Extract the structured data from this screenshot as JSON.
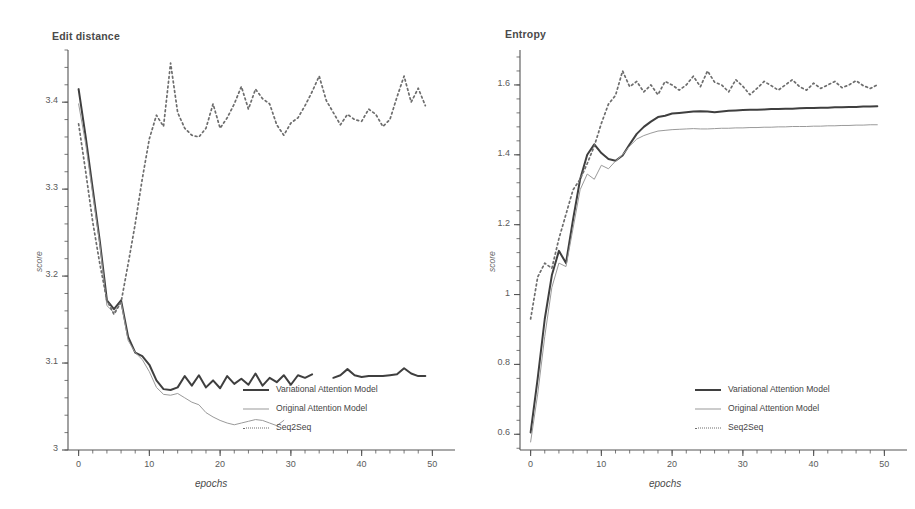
{
  "figure": {
    "background": "#ffffff",
    "colors": {
      "variational": "#3f3f3f",
      "original": "#9a9a9a",
      "seq2seq": "#6d6d6d",
      "axis": "#555555",
      "text": "#4a4a4a"
    }
  },
  "legend_labels": {
    "variational": "Variational Attention Model",
    "original": "Original Attention Model",
    "seq2seq": "Seq2Seq"
  },
  "panels": [
    {
      "title": "Edit distance",
      "xlabel": "epochs",
      "ylabel": "score"
    },
    {
      "title": "Entropy",
      "xlabel": "epochs",
      "ylabel": "score"
    }
  ],
  "chart_data": [
    {
      "type": "line",
      "title": "Edit distance",
      "xlabel": "epochs",
      "ylabel": "score",
      "xlim": [
        -1.5,
        51.5
      ],
      "ylim": [
        3.0,
        3.46
      ],
      "xticks": [
        0,
        10,
        20,
        30,
        40,
        50
      ],
      "xtick_labels": [
        "0",
        "10",
        "20",
        "30",
        "40",
        "50"
      ],
      "yticks": [
        3.0,
        3.1,
        3.2,
        3.3,
        3.4
      ],
      "ytick_labels": [
        "3",
        "3.1",
        "3.2",
        "3.3",
        "3.4"
      ],
      "minor_ticks": true,
      "grid": false,
      "legend_position": "lower right",
      "x": [
        0,
        1,
        2,
        3,
        4,
        5,
        6,
        7,
        8,
        9,
        10,
        11,
        12,
        13,
        14,
        15,
        16,
        17,
        18,
        19,
        20,
        21,
        22,
        23,
        24,
        25,
        26,
        27,
        28,
        29,
        30,
        31,
        32,
        33,
        34,
        35,
        36,
        37,
        38,
        39,
        40,
        41,
        42,
        43,
        44,
        45,
        46,
        47,
        48,
        49
      ],
      "series": [
        {
          "name": "Variational Attention Model",
          "style": "solid-thick",
          "color": "#3f3f3f",
          "values": [
            3.415,
            3.36,
            3.3,
            3.24,
            3.172,
            3.162,
            3.172,
            3.13,
            3.112,
            3.108,
            3.098,
            3.08,
            3.07,
            3.069,
            3.072,
            3.085,
            3.074,
            3.086,
            3.072,
            3.08,
            3.071,
            3.085,
            3.076,
            3.082,
            3.075,
            3.088,
            3.074,
            3.083,
            3.078,
            3.086,
            3.075,
            3.086,
            3.083,
            3.087,
            null,
            null,
            3.083,
            3.086,
            3.093,
            3.086,
            3.084,
            3.085,
            3.085,
            3.085,
            3.086,
            3.087,
            3.094,
            3.088,
            3.085,
            3.085
          ]
        },
        {
          "name": "Original Attention Model",
          "style": "solid-thin",
          "color": "#9a9a9a",
          "values": [
            3.398,
            3.352,
            3.294,
            3.236,
            3.166,
            3.158,
            3.17,
            3.126,
            3.112,
            3.104,
            3.09,
            3.072,
            3.064,
            3.063,
            3.065,
            3.06,
            3.055,
            3.052,
            3.043,
            3.038,
            3.034,
            3.031,
            3.029,
            3.031,
            3.033,
            3.035,
            3.034,
            3.031,
            3.028,
            3.034,
            null,
            null,
            null,
            null,
            null,
            null,
            null,
            null,
            null,
            null,
            null,
            null,
            null,
            null,
            null,
            null,
            null,
            null,
            null,
            null
          ]
        },
        {
          "name": "Seq2Seq",
          "style": "dotted",
          "color": "#6d6d6d",
          "values": [
            3.375,
            3.32,
            3.262,
            3.214,
            3.172,
            3.156,
            3.17,
            3.214,
            3.26,
            3.312,
            3.358,
            3.385,
            3.372,
            3.445,
            3.388,
            3.37,
            3.362,
            3.36,
            3.37,
            3.398,
            3.37,
            3.382,
            3.398,
            3.418,
            3.392,
            3.415,
            3.404,
            3.398,
            3.374,
            3.362,
            3.376,
            3.382,
            3.396,
            3.412,
            3.43,
            3.402,
            3.388,
            3.374,
            3.386,
            3.38,
            3.378,
            3.392,
            3.386,
            3.372,
            3.38,
            3.406,
            3.43,
            3.4,
            3.416,
            3.396
          ]
        }
      ]
    },
    {
      "type": "line",
      "title": "Entropy",
      "xlabel": "epochs",
      "ylabel": "score",
      "xlim": [
        -1.5,
        51.5
      ],
      "ylim": [
        0.555,
        1.7
      ],
      "xticks": [
        0,
        10,
        20,
        30,
        40,
        50
      ],
      "xtick_labels": [
        "0",
        "10",
        "20",
        "30",
        "40",
        "50"
      ],
      "yticks": [
        0.6,
        0.8,
        1.0,
        1.2,
        1.4,
        1.6
      ],
      "ytick_labels": [
        "0.6",
        "0.8",
        "1",
        "1.2",
        "1.4",
        "1.6"
      ],
      "minor_ticks": true,
      "grid": false,
      "legend_position": "lower right",
      "x": [
        0,
        1,
        2,
        3,
        4,
        5,
        6,
        7,
        8,
        9,
        10,
        11,
        12,
        13,
        14,
        15,
        16,
        17,
        18,
        19,
        20,
        21,
        22,
        23,
        24,
        25,
        26,
        27,
        28,
        29,
        30,
        31,
        32,
        33,
        34,
        35,
        36,
        37,
        38,
        39,
        40,
        41,
        42,
        43,
        44,
        45,
        46,
        47,
        48,
        49
      ],
      "series": [
        {
          "name": "Variational Attention Model",
          "style": "solid-thick",
          "color": "#3f3f3f",
          "values": [
            0.605,
            0.76,
            0.93,
            1.055,
            1.125,
            1.09,
            1.215,
            1.33,
            1.4,
            1.43,
            1.405,
            1.388,
            1.383,
            1.398,
            1.43,
            1.46,
            1.48,
            1.495,
            1.508,
            1.512,
            1.518,
            1.52,
            1.522,
            1.524,
            1.525,
            1.524,
            1.522,
            1.524,
            1.526,
            1.527,
            1.528,
            1.529,
            1.529,
            1.53,
            1.531,
            1.531,
            1.532,
            1.532,
            1.533,
            1.534,
            1.534,
            1.535,
            1.535,
            1.536,
            1.536,
            1.537,
            1.537,
            1.538,
            1.538,
            1.539
          ]
        },
        {
          "name": "Original Attention Model",
          "style": "solid-thin",
          "color": "#9a9a9a",
          "values": [
            0.578,
            0.715,
            0.88,
            1.02,
            1.09,
            1.08,
            1.19,
            1.3,
            1.345,
            1.33,
            1.37,
            1.36,
            1.382,
            1.4,
            1.425,
            1.445,
            1.455,
            1.462,
            1.468,
            1.47,
            1.472,
            1.473,
            1.474,
            1.475,
            1.474,
            1.474,
            1.475,
            1.476,
            1.476,
            1.477,
            1.477,
            1.478,
            1.478,
            1.479,
            1.479,
            1.48,
            1.48,
            1.481,
            1.481,
            1.481,
            1.482,
            1.482,
            1.483,
            1.483,
            1.484,
            1.484,
            1.485,
            1.485,
            1.486,
            1.486
          ]
        },
        {
          "name": "Seq2Seq",
          "style": "dotted",
          "color": "#6d6d6d",
          "values": [
            0.93,
            1.05,
            1.09,
            1.075,
            1.16,
            1.23,
            1.3,
            1.33,
            1.375,
            1.425,
            1.49,
            1.545,
            1.57,
            1.64,
            1.595,
            1.61,
            1.58,
            1.6,
            1.572,
            1.61,
            1.6,
            1.585,
            1.6,
            1.625,
            1.595,
            1.64,
            1.608,
            1.6,
            1.58,
            1.615,
            1.596,
            1.572,
            1.59,
            1.61,
            1.598,
            1.585,
            1.6,
            1.615,
            1.595,
            1.585,
            1.605,
            1.59,
            1.6,
            1.61,
            1.592,
            1.6,
            1.612,
            1.598,
            1.59,
            1.6
          ]
        }
      ]
    }
  ]
}
